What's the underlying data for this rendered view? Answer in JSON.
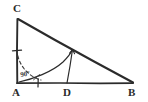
{
  "figure": {
    "kind": "hand-drawn-geometry-sketch",
    "background_color": "#ffffff",
    "stroke_color": "#2b2b2b",
    "light_stroke_color": "#555555",
    "canvas": {
      "width": 148,
      "height": 102
    },
    "vertices": [
      {
        "id": "C",
        "label": "C",
        "x": 17,
        "y": 18,
        "label_x": 13,
        "label_y": 3
      },
      {
        "id": "A",
        "label": "A",
        "x": 17,
        "y": 83,
        "label_x": 12,
        "label_y": 87
      },
      {
        "id": "B",
        "label": "B",
        "x": 133,
        "y": 83,
        "label_x": 128,
        "label_y": 87
      },
      {
        "id": "D",
        "label": "D",
        "x": 67,
        "y": 83,
        "label_x": 63,
        "label_y": 87
      }
    ],
    "angle_marks": [
      {
        "id": "right-angle-at-A",
        "label": "90°",
        "vertex": "A",
        "label_x": 21,
        "label_y": 72,
        "arc_radius": 30,
        "style": "dashed"
      }
    ],
    "segments": [
      {
        "id": "side-CA",
        "from": "C",
        "to": "A",
        "style": "solid"
      },
      {
        "id": "side-AB",
        "from": "A",
        "to": "B",
        "style": "solid"
      },
      {
        "id": "side-CB-hypotenuse",
        "from": "C",
        "to": "B",
        "style": "solid"
      },
      {
        "id": "segment-D-to-hypotenuse",
        "from": "D",
        "to": "E",
        "style": "solid"
      }
    ],
    "curves": [
      {
        "id": "arc-A-to-hypotenuse",
        "description": "curved arc sweeping from near A up to point E on the hypotenuse",
        "from_x": 19,
        "from_y": 82,
        "to_x": 72,
        "to_y": 50,
        "style": "solid"
      }
    ],
    "tick_marks": [
      {
        "id": "tick-on-CA",
        "x": 17,
        "y": 51,
        "orientation": "horizontal"
      },
      {
        "id": "tick-on-AB",
        "x": 38,
        "y": 83,
        "orientation": "vertical"
      },
      {
        "id": "tick-crossing-arc",
        "x": 36,
        "y": 77,
        "orientation": "diagonal"
      }
    ],
    "points_on_hypotenuse": [
      {
        "id": "E",
        "x": 72,
        "y": 50,
        "labeled": false
      }
    ]
  }
}
